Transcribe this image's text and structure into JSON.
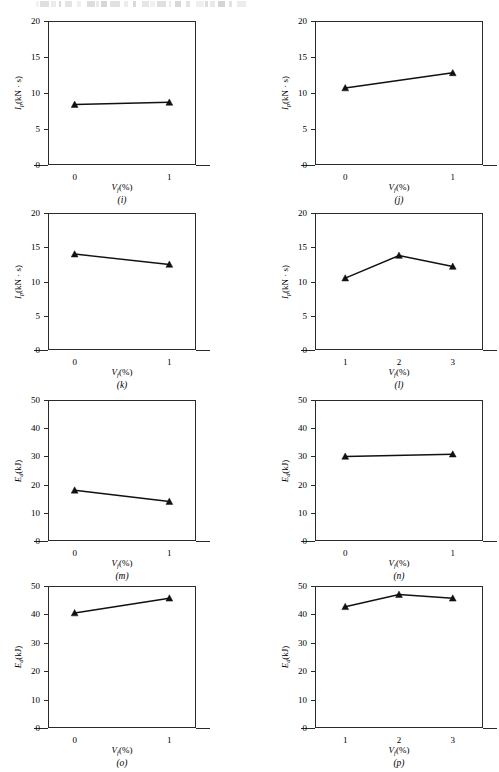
{
  "figure": {
    "axis_color": "#2a2a2a",
    "line_color": "#111111",
    "marker": "filled-triangle",
    "x_axis_label_html": "V<sub>f</sub>(%)",
    "y_axis_label_impulse_html": "I<sub>p</sub>(kN · s)",
    "y_axis_label_energy_html": "E<sub>d</sub>(kJ)"
  },
  "chart_data": [
    {
      "type": "line",
      "panel": "(i)",
      "title": "",
      "xlabel": "Vf(%)",
      "ylabel": "Ip(kN · s)",
      "x": [
        0,
        1
      ],
      "xticklabels": [
        "0",
        "1"
      ],
      "values": [
        8.4,
        8.7
      ],
      "xlim": [
        0,
        1
      ],
      "ylim": [
        0,
        20
      ],
      "yticks": [
        0,
        5,
        10,
        15,
        20
      ],
      "yticklabels": [
        "0",
        "5",
        "10",
        "15",
        "20"
      ],
      "grid": false,
      "legend": "none"
    },
    {
      "type": "line",
      "panel": "(j)",
      "title": "",
      "xlabel": "Vf(%)",
      "ylabel": "Ip(kN · s)",
      "x": [
        0,
        1
      ],
      "xticklabels": [
        "0",
        "1"
      ],
      "values": [
        10.7,
        12.8
      ],
      "xlim": [
        0,
        1
      ],
      "ylim": [
        0,
        20
      ],
      "yticks": [
        0,
        5,
        10,
        15,
        20
      ],
      "yticklabels": [
        "0",
        "5",
        "10",
        "15",
        "20"
      ],
      "grid": false,
      "legend": "none"
    },
    {
      "type": "line",
      "panel": "(k)",
      "title": "",
      "xlabel": "Vf(%)",
      "ylabel": "Ip(kN · s)",
      "x": [
        0,
        1
      ],
      "xticklabels": [
        "0",
        "1"
      ],
      "values": [
        14.0,
        12.5
      ],
      "xlim": [
        0,
        1
      ],
      "ylim": [
        0,
        20
      ],
      "yticks": [
        0,
        5,
        10,
        15,
        20
      ],
      "yticklabels": [
        "0",
        "5",
        "10",
        "15",
        "20"
      ],
      "grid": false,
      "legend": "none"
    },
    {
      "type": "line",
      "panel": "(l)",
      "title": "",
      "xlabel": "Vf(%)",
      "ylabel": "Ip(kN · s)",
      "x": [
        1,
        2,
        3
      ],
      "xticklabels": [
        "1",
        "2",
        "3"
      ],
      "values": [
        10.5,
        13.8,
        12.2
      ],
      "xlim": [
        1,
        3
      ],
      "ylim": [
        0,
        20
      ],
      "yticks": [
        0,
        5,
        10,
        15,
        20
      ],
      "yticklabels": [
        "0",
        "5",
        "10",
        "15",
        "20"
      ],
      "grid": false,
      "legend": "none"
    },
    {
      "type": "line",
      "panel": "(m)",
      "title": "",
      "xlabel": "Vf(%)",
      "ylabel": "Ed(kJ)",
      "x": [
        0,
        1
      ],
      "xticklabels": [
        "0",
        "1"
      ],
      "values": [
        18.0,
        14.0
      ],
      "xlim": [
        0,
        1
      ],
      "ylim": [
        0,
        50
      ],
      "yticks": [
        0,
        10,
        20,
        30,
        40,
        50
      ],
      "yticklabels": [
        "0",
        "10",
        "20",
        "30",
        "40",
        "50"
      ],
      "grid": false,
      "legend": "none"
    },
    {
      "type": "line",
      "panel": "(n)",
      "title": "",
      "xlabel": "Vf(%)",
      "ylabel": "Ed(kJ)",
      "x": [
        0,
        1
      ],
      "xticklabels": [
        "0",
        "1"
      ],
      "values": [
        30.0,
        30.8
      ],
      "xlim": [
        0,
        1
      ],
      "ylim": [
        0,
        50
      ],
      "yticks": [
        0,
        10,
        20,
        30,
        40,
        50
      ],
      "yticklabels": [
        "0",
        "10",
        "20",
        "30",
        "40",
        "50"
      ],
      "grid": false,
      "legend": "none"
    },
    {
      "type": "line",
      "panel": "(o)",
      "title": "",
      "xlabel": "Vf(%)",
      "ylabel": "Ed(kJ)",
      "x": [
        0,
        1
      ],
      "xticklabels": [
        "0",
        "1"
      ],
      "values": [
        40.5,
        45.7
      ],
      "xlim": [
        0,
        1
      ],
      "ylim": [
        0,
        50
      ],
      "yticks": [
        0,
        10,
        20,
        30,
        40,
        50
      ],
      "yticklabels": [
        "0",
        "10",
        "20",
        "30",
        "40",
        "50"
      ],
      "grid": false,
      "legend": "none"
    },
    {
      "type": "line",
      "panel": "(p)",
      "title": "",
      "xlabel": "Vf(%)",
      "ylabel": "Ed(kJ)",
      "x": [
        1,
        2,
        3
      ],
      "xticklabels": [
        "1",
        "2",
        "3"
      ],
      "values": [
        42.7,
        47.0,
        45.7
      ],
      "xlim": [
        1,
        3
      ],
      "ylim": [
        0,
        50
      ],
      "yticks": [
        0,
        10,
        20,
        30,
        40,
        50
      ],
      "yticklabels": [
        "0",
        "10",
        "20",
        "30",
        "40",
        "50"
      ],
      "grid": false,
      "legend": "none"
    }
  ]
}
